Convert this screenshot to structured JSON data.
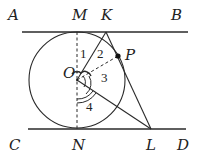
{
  "diagram": {
    "type": "geometry",
    "colors": {
      "stroke": "#2a2a2a",
      "background": "#ffffff"
    },
    "points": {
      "A": "A",
      "B": "B",
      "C": "C",
      "D": "D",
      "M": "M",
      "K": "K",
      "P": "P",
      "O": "O",
      "N": "N",
      "L": "L"
    },
    "angles": {
      "a1": "1",
      "a2": "2",
      "a3": "3",
      "a4": "4"
    }
  }
}
